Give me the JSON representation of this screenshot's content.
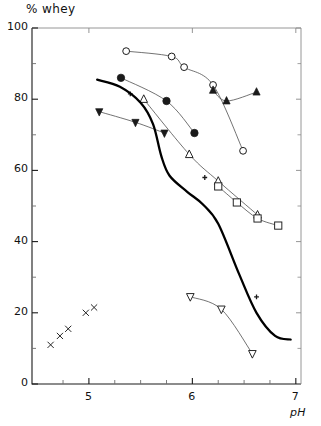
{
  "chart_data": {
    "type": "scatter",
    "title": "",
    "xlabel": "pH",
    "ylabel": "% whey",
    "xlim": [
      4.45,
      7.05
    ],
    "ylim": [
      0,
      100
    ],
    "grid": false,
    "legend": "none",
    "x_ticks_major": [
      5,
      6,
      7
    ],
    "x_tick_labels": [
      "5",
      "6",
      "7"
    ],
    "x_ticks_minor": [
      4.75,
      5.25,
      5.5,
      5.75,
      6.25,
      6.5,
      6.75
    ],
    "y_ticks_major": [
      0,
      20,
      40,
      60,
      80,
      100
    ],
    "y_tick_labels": [
      "0",
      "20",
      "40",
      "60",
      "80",
      "100"
    ],
    "y_ticks_minor": [
      10,
      30,
      50,
      70,
      90
    ],
    "series": [
      {
        "name": "open-circle",
        "marker": "circle-open",
        "connected": true,
        "points": [
          {
            "x": 5.36,
            "y": 93.5
          },
          {
            "x": 5.8,
            "y": 92.0
          },
          {
            "x": 5.92,
            "y": 89.0
          },
          {
            "x": 6.2,
            "y": 84.0
          },
          {
            "x": 6.49,
            "y": 65.5
          }
        ]
      },
      {
        "name": "filled-circle",
        "marker": "circle-filled",
        "connected": true,
        "points": [
          {
            "x": 5.31,
            "y": 86.0
          },
          {
            "x": 5.75,
            "y": 79.5
          },
          {
            "x": 6.02,
            "y": 70.5
          }
        ]
      },
      {
        "name": "filled-triangle-down",
        "marker": "triangle-down-filled",
        "connected": true,
        "points": [
          {
            "x": 5.1,
            "y": 76.5
          },
          {
            "x": 5.45,
            "y": 73.5
          },
          {
            "x": 5.73,
            "y": 70.5
          }
        ]
      },
      {
        "name": "filled-triangle-up",
        "marker": "triangle-up-filled",
        "connected": true,
        "points": [
          {
            "x": 6.2,
            "y": 82.5
          },
          {
            "x": 6.33,
            "y": 79.5
          },
          {
            "x": 6.62,
            "y": 82.0
          }
        ]
      },
      {
        "name": "open-triangle-up",
        "marker": "triangle-up-open",
        "connected": true,
        "points": [
          {
            "x": 5.53,
            "y": 80.0
          },
          {
            "x": 5.97,
            "y": 64.5
          },
          {
            "x": 6.25,
            "y": 57.0
          },
          {
            "x": 6.63,
            "y": 47.5
          }
        ]
      },
      {
        "name": "open-square",
        "marker": "square-open",
        "connected": true,
        "points": [
          {
            "x": 6.25,
            "y": 55.5
          },
          {
            "x": 6.43,
            "y": 51.0
          },
          {
            "x": 6.63,
            "y": 46.5
          },
          {
            "x": 6.83,
            "y": 44.5
          }
        ]
      },
      {
        "name": "open-triangle-down",
        "marker": "triangle-down-open",
        "connected": true,
        "points": [
          {
            "x": 5.98,
            "y": 24.5
          },
          {
            "x": 6.28,
            "y": 21.0
          },
          {
            "x": 6.58,
            "y": 8.5
          }
        ]
      },
      {
        "name": "plus-small",
        "marker": "plus",
        "connected": false,
        "points": [
          {
            "x": 5.4,
            "y": 81.5
          },
          {
            "x": 6.12,
            "y": 58.0
          },
          {
            "x": 6.62,
            "y": 24.5
          }
        ]
      },
      {
        "name": "cross-x",
        "marker": "x",
        "connected": false,
        "points": [
          {
            "x": 4.63,
            "y": 11.0
          },
          {
            "x": 4.72,
            "y": 13.5
          },
          {
            "x": 4.8,
            "y": 15.5
          },
          {
            "x": 4.97,
            "y": 20.0
          },
          {
            "x": 5.05,
            "y": 21.5
          }
        ]
      },
      {
        "name": "thick-trend-curve",
        "marker": "none",
        "line": "thick",
        "points": [
          {
            "x": 5.08,
            "y": 85.5
          },
          {
            "x": 5.3,
            "y": 83.5
          },
          {
            "x": 5.5,
            "y": 79.0
          },
          {
            "x": 5.62,
            "y": 73.0
          },
          {
            "x": 5.7,
            "y": 64.0
          },
          {
            "x": 5.78,
            "y": 58.5
          },
          {
            "x": 5.95,
            "y": 54.0
          },
          {
            "x": 6.1,
            "y": 50.5
          },
          {
            "x": 6.25,
            "y": 45.0
          },
          {
            "x": 6.45,
            "y": 31.0
          },
          {
            "x": 6.62,
            "y": 20.0
          },
          {
            "x": 6.8,
            "y": 13.5
          },
          {
            "x": 6.95,
            "y": 12.5
          }
        ]
      }
    ]
  }
}
